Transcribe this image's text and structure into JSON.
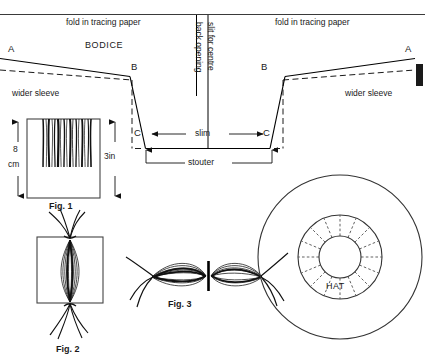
{
  "figure": {
    "page_rule": "horizontal rule across top",
    "ink_color": "#000000",
    "paper_color": "#ffffff"
  },
  "bodice": {
    "fold_left_label": "fold in tracing paper",
    "fold_right_label": "fold in tracing paper",
    "name_label": "BODICE",
    "point_a_left": "A",
    "point_a_right": "A",
    "point_b_left": "B",
    "point_b_right": "B",
    "point_c_left": "C",
    "point_c_right": "C",
    "sleeve_left_label": "wider sleeve",
    "sleeve_right_label": "wider sleeve",
    "back_opening_label": "back opening",
    "slit_label": "slit for centre",
    "slim_label": "slim",
    "stouter_label": "stouter"
  },
  "fig1": {
    "caption": "Fig. 1",
    "dim_left_value": "8",
    "dim_left_unit": "cm",
    "dim_right_value": "3in"
  },
  "fig2": {
    "caption": "Fig. 2"
  },
  "fig3": {
    "caption": "Fig. 3"
  },
  "hat": {
    "label": "HAT",
    "spoke_count": 16,
    "ring_count": 3
  }
}
